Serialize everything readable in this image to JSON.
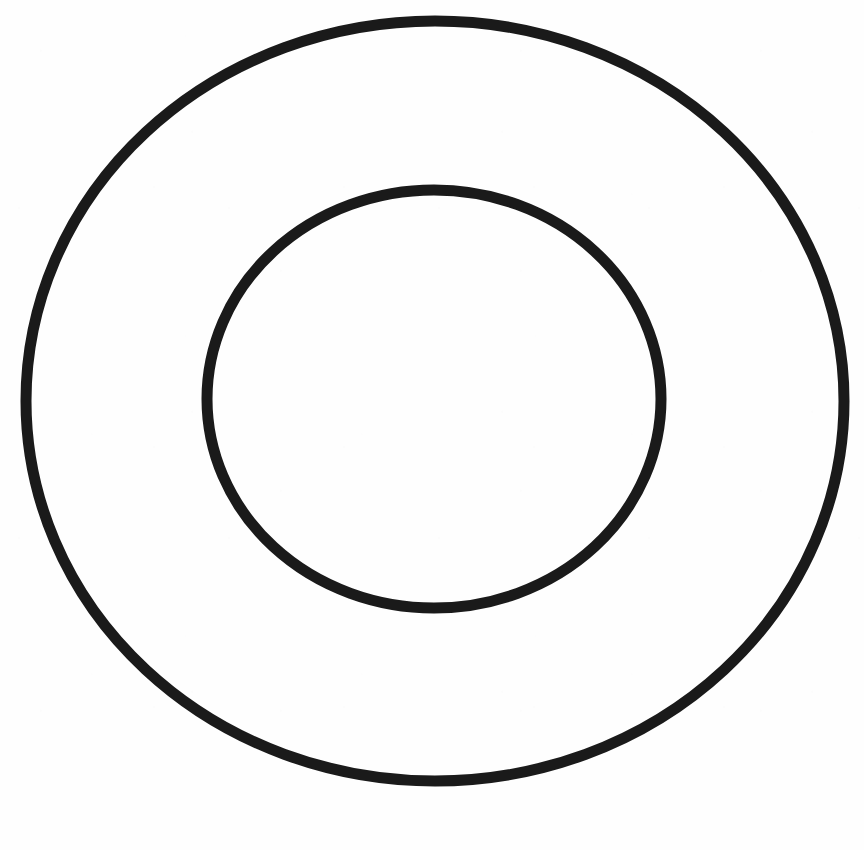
{
  "document": {
    "title": "Concentric Circles Figure",
    "background_color": "#fefefe",
    "width": 864,
    "height": 850
  },
  "chart_data": {
    "type": "diagram",
    "subtype": "concentric-circles",
    "title": "",
    "subtitle": "",
    "xlabel": "",
    "ylabel": "",
    "grid": false,
    "legend": null,
    "annotations": [],
    "tick_labels": [],
    "background_color": "#fefefe",
    "stroke_color": "#1a1a1a",
    "shape_count": 2,
    "shapes": [
      {
        "name": "outer-circle",
        "type": "ellipse",
        "center_x": 435,
        "center_y": 401,
        "radius_x": 409,
        "radius_y": 380,
        "stroke_width": 11,
        "stroke_color": "#1a1a1a",
        "fill": "none",
        "bounds": {
          "left": 26,
          "top": 21,
          "right": 844,
          "bottom": 781
        },
        "label": ""
      },
      {
        "name": "inner-circle",
        "type": "ellipse",
        "center_x": 434,
        "center_y": 399,
        "radius_x": 227,
        "radius_y": 209,
        "stroke_width": 11,
        "stroke_color": "#1a1a1a",
        "fill": "none",
        "bounds": {
          "left": 207,
          "top": 190,
          "right": 661,
          "bottom": 608
        },
        "label": ""
      }
    ]
  }
}
